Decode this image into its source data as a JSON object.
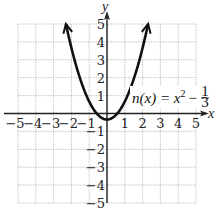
{
  "chart_data": {
    "type": "line",
    "title": "",
    "function_label": "n(x) = x^2 - 1/3",
    "label_parts": {
      "lhs": "n(x) = x",
      "exp": "2",
      "minus": "−",
      "frac_num": "1",
      "frac_den": "3"
    },
    "xlabel": "x",
    "ylabel": "y",
    "xlim": [
      -5,
      5
    ],
    "ylim": [
      -5,
      5
    ],
    "grid": true,
    "x_ticks": [
      "−5",
      "−4",
      "−3",
      "−2",
      "−1",
      "1",
      "2",
      "3",
      "4",
      "5"
    ],
    "y_ticks": [
      "5",
      "4",
      "3",
      "2",
      "1",
      "−1",
      "−2",
      "−3",
      "−4",
      "−5"
    ],
    "x_tick_values": [
      -5,
      -4,
      -3,
      -2,
      -1,
      1,
      2,
      3,
      4,
      5
    ],
    "y_tick_values": [
      5,
      4,
      3,
      2,
      1,
      -1,
      -2,
      -3,
      -4,
      -5
    ],
    "series": [
      {
        "name": "n(x)",
        "x": [
          -2.31,
          -2,
          -1.5,
          -1,
          -0.5,
          0,
          0.5,
          1,
          1.5,
          2,
          2.31
        ],
        "values": [
          5.0,
          3.667,
          1.917,
          0.667,
          -0.083,
          -0.333,
          -0.083,
          0.667,
          1.917,
          3.667,
          5.0
        ],
        "arrows_at_ends": true
      }
    ],
    "vertex": [
      0,
      -0.333
    ]
  }
}
